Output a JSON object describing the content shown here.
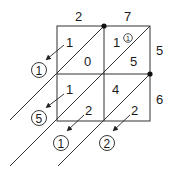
{
  "diagram": {
    "type": "lattice-multiplication",
    "top_digits": [
      "2",
      "7"
    ],
    "right_digits": [
      "5",
      "6"
    ],
    "cells": [
      {
        "row": 0,
        "col": 0,
        "tens": "1",
        "ones": "0"
      },
      {
        "row": 0,
        "col": 1,
        "tens": "3",
        "ones": "5",
        "carry": "1"
      },
      {
        "row": 1,
        "col": 0,
        "tens": "1",
        "ones": "2"
      },
      {
        "row": 1,
        "col": 1,
        "tens": "4",
        "ones": "2"
      }
    ],
    "results_left": [
      "1",
      "5"
    ],
    "results_bottom": [
      "1",
      "2"
    ],
    "colors": {
      "line": "#333333",
      "text": "#1a1a1a",
      "background": "#ffffff"
    }
  }
}
